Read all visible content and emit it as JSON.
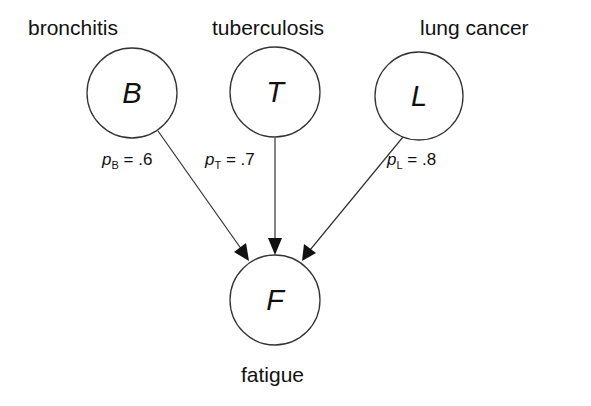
{
  "diagram": {
    "type": "bayesian-network",
    "nodes": [
      {
        "id": "B",
        "letter": "B",
        "label": "bronchitis",
        "prob_symbol": "p",
        "prob_sub": "B",
        "prob_value": "= .6"
      },
      {
        "id": "T",
        "letter": "T",
        "label": "tuberculosis",
        "prob_symbol": "p",
        "prob_sub": "T",
        "prob_value": "= .7"
      },
      {
        "id": "L",
        "letter": "L",
        "label": "lung cancer",
        "prob_symbol": "p",
        "prob_sub": "L",
        "prob_value": "= .8"
      },
      {
        "id": "F",
        "letter": "F",
        "label": "fatigue"
      }
    ],
    "edges": [
      {
        "from": "B",
        "to": "F"
      },
      {
        "from": "T",
        "to": "F"
      },
      {
        "from": "L",
        "to": "F"
      }
    ],
    "colors": {
      "stroke": "#333333",
      "text": "#111111",
      "background": "#ffffff"
    }
  }
}
